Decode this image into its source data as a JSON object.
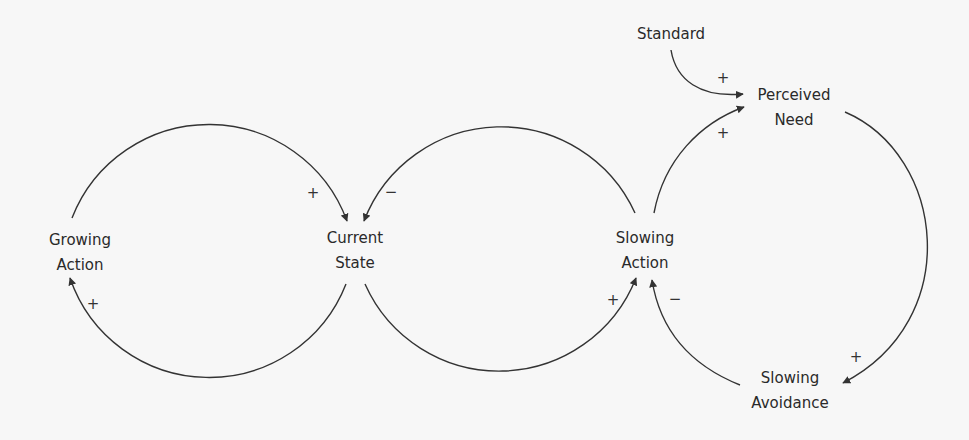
{
  "diagram": {
    "type": "causal-loop",
    "colors": {
      "background": "#f7f7f7",
      "line": "#333333",
      "text": "#2a2a2a"
    },
    "nodes": {
      "growing_action": {
        "line1": "Growing",
        "line2": "Action"
      },
      "current_state": {
        "line1": "Current",
        "line2": "State"
      },
      "slowing_action": {
        "line1": "Slowing",
        "line2": "Action"
      },
      "standard": {
        "line1": "Standard"
      },
      "perceived_need": {
        "line1": "Perceived",
        "line2": "Need"
      },
      "slowing_avoidance": {
        "line1": "Slowing",
        "line2": "Avoidance"
      }
    },
    "links": [
      {
        "from": "Growing Action",
        "to": "Current State",
        "polarity": "+"
      },
      {
        "from": "Current State",
        "to": "Growing Action",
        "polarity": "+"
      },
      {
        "from": "Slowing Action",
        "to": "Current State",
        "polarity": "−"
      },
      {
        "from": "Current State",
        "to": "Slowing Action",
        "polarity": "+"
      },
      {
        "from": "Standard",
        "to": "Perceived Need",
        "polarity": "+"
      },
      {
        "from": "Slowing Action",
        "to": "Perceived Need",
        "polarity": "+"
      },
      {
        "from": "Perceived Need",
        "to": "Slowing Avoidance",
        "polarity": "+"
      },
      {
        "from": "Slowing Avoidance",
        "to": "Slowing Action",
        "polarity": "−"
      }
    ],
    "signs": {
      "s1": "+",
      "s2": "−",
      "s3": "+",
      "s4": "+",
      "s5": "−",
      "s6": "+",
      "s7": "+",
      "s8": "+"
    }
  }
}
